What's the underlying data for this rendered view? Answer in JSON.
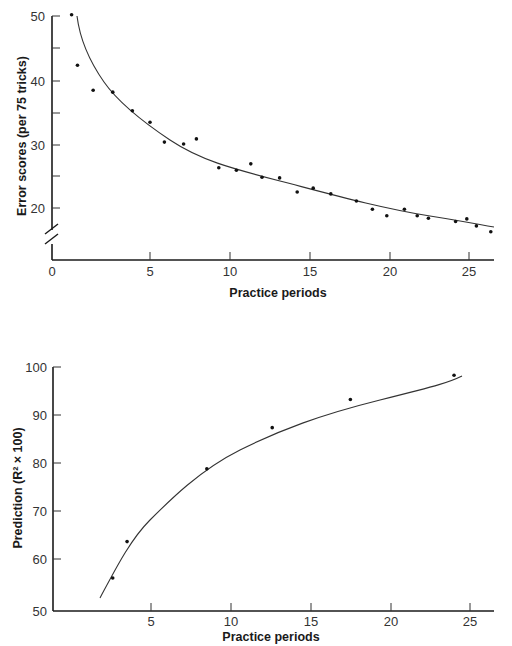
{
  "chart_data": [
    {
      "type": "scatter",
      "title": "",
      "xlabel": "Practice periods",
      "ylabel": "Error scores (per 75 tricks)",
      "x_ticks": [
        "0",
        "5",
        "10",
        "15",
        "20",
        "25"
      ],
      "y_ticks": [
        "20",
        "30",
        "40",
        "50"
      ],
      "xlim": [
        0,
        27
      ],
      "ylim": [
        15,
        50
      ],
      "y_axis_break": true,
      "grid": false,
      "legend": null,
      "fit_curve": "decreasing power-law fit",
      "series": [
        {
          "name": "Error scores",
          "points": [
            [
              1.0,
              50.2
            ],
            [
              1.3,
              42.3
            ],
            [
              2.1,
              38.4
            ],
            [
              3.1,
              38.1
            ],
            [
              4.1,
              35.2
            ],
            [
              5.0,
              33.4
            ],
            [
              5.9,
              30.3
            ],
            [
              7.1,
              30.0
            ],
            [
              7.9,
              30.8
            ],
            [
              9.3,
              26.3
            ],
            [
              10.4,
              25.9
            ],
            [
              11.3,
              26.9
            ],
            [
              12.0,
              24.8
            ],
            [
              13.1,
              24.7
            ],
            [
              14.2,
              22.5
            ],
            [
              15.2,
              23.1
            ],
            [
              16.3,
              22.2
            ],
            [
              17.9,
              21.1
            ],
            [
              18.9,
              19.8
            ],
            [
              19.8,
              18.8
            ],
            [
              20.9,
              19.8
            ],
            [
              21.7,
              18.8
            ],
            [
              22.4,
              18.4
            ],
            [
              24.1,
              17.9
            ],
            [
              24.8,
              18.3
            ],
            [
              25.4,
              17.2
            ],
            [
              26.3,
              16.3
            ]
          ]
        }
      ]
    },
    {
      "type": "scatter",
      "title": "",
      "xlabel": "Practice periods",
      "ylabel": "Prediction (R² × 100)",
      "x_ticks": [
        "5",
        "10",
        "15",
        "20",
        "25"
      ],
      "y_ticks": [
        "50",
        "60",
        "70",
        "80",
        "90",
        "100"
      ],
      "xlim": [
        1,
        27
      ],
      "ylim": [
        50,
        100
      ],
      "grid": false,
      "legend": null,
      "fit_curve": "increasing saturating fit",
      "series": [
        {
          "name": "Prediction",
          "points": [
            [
              2.6,
              56.5
            ],
            [
              3.5,
              64.0
            ],
            [
              8.5,
              79.0
            ],
            [
              12.6,
              87.5
            ],
            [
              17.5,
              93.3
            ],
            [
              24.0,
              98.3
            ]
          ]
        }
      ]
    }
  ],
  "top_chart": {
    "ylabel": "Error scores (per 75 tricks)",
    "xlabel": "Practice periods",
    "x_ticks": [
      "0",
      "5",
      "10",
      "15",
      "20",
      "25"
    ],
    "y_ticks": [
      "20",
      "30",
      "40",
      "50"
    ]
  },
  "bottom_chart": {
    "ylabel": "Prediction (R² × 100)",
    "xlabel": "Practice periods",
    "x_ticks": [
      "5",
      "10",
      "15",
      "20",
      "25"
    ],
    "y_ticks": [
      "50",
      "60",
      "70",
      "80",
      "90",
      "100"
    ]
  }
}
